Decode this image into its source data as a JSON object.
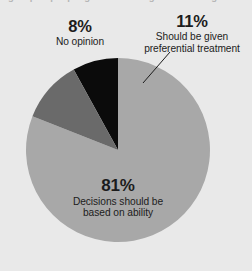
{
  "figure": {
    "cut_headline": "a group of people given advantage when hiring because of their race",
    "background_color": "#e9e9e9"
  },
  "chart_data": {
    "type": "pie",
    "title": "",
    "subtitle": "",
    "xlabel": "",
    "ylabel": "",
    "legend_position": "none",
    "grid": false,
    "center": [
      118,
      150
    ],
    "radius": 92,
    "start_angle_deg": -90,
    "categories": [
      "Decisions should be based on ability",
      "Should be given preferential treatment",
      "No opinion"
    ],
    "values": [
      81,
      11,
      8
    ],
    "value_labels": [
      "81%",
      "11%",
      "8%"
    ],
    "colors": [
      "#a8a8a8",
      "#6a6a6a",
      "#0b0b0b"
    ],
    "slices": [
      {
        "label": "Decisions should be based on ability",
        "value": 81,
        "value_label": "81%",
        "color": "#a8a8a8",
        "label_lines": [
          "Decisions should be",
          "based on ability"
        ],
        "label_placement": "inside"
      },
      {
        "label": "Should be given preferential treatment",
        "value": 11,
        "value_label": "11%",
        "color": "#6a6a6a",
        "label_lines": [
          "Should be given",
          "preferential treatment"
        ],
        "label_placement": "outside-right",
        "leader_line": true
      },
      {
        "label": "No opinion",
        "value": 8,
        "value_label": "8%",
        "color": "#0b0b0b",
        "label_lines": [
          "No opinion"
        ],
        "label_placement": "outside-left"
      }
    ]
  },
  "labels": {
    "no_opinion": {
      "pct": "8%",
      "line1": "No opinion"
    },
    "preferential": {
      "pct": "11%",
      "line1": "Should be given",
      "line2": "preferential treatment"
    },
    "ability": {
      "pct": "81%",
      "line1": "Decisions should be",
      "line2": "based on ability"
    }
  }
}
